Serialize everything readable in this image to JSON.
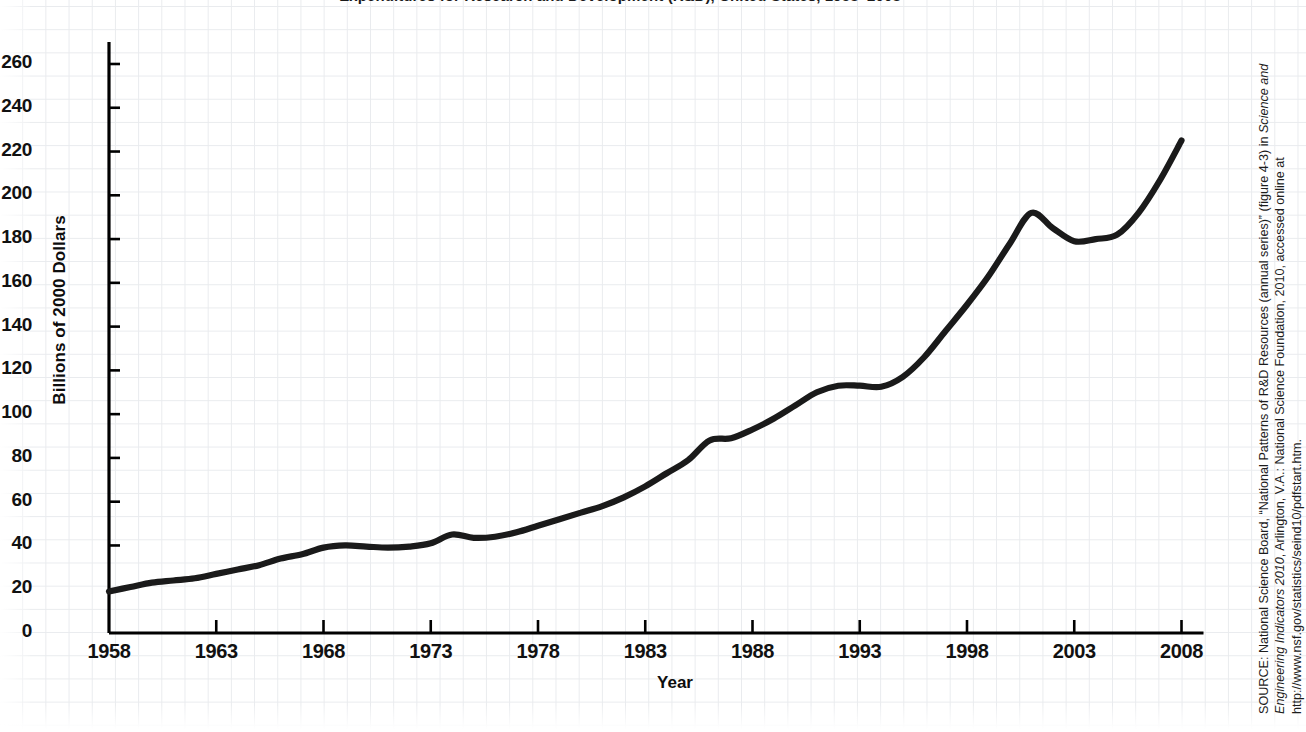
{
  "figure": {
    "title_truncated": "Expenditures for Research and Development (R&D), United States, 1958–2008",
    "ylabel": "Billions of 2000 Dollars",
    "xlabel": "Year",
    "source_prefix": "SOURCE: National Science Board, “National Patterns of R&D Resources (annual series)” (figure 4-3) in ",
    "source_italic": "Science and Engineering Indicators 2010",
    "source_suffix": ", Arlington, V.A.: National Science Foundation, 2010, accessed online at http://www.nsf.gov/statistics/seind10/pdfstart.htm.",
    "line_color": "#1a1a1a",
    "axis_color": "#000000",
    "grid_color": "#e9ebee"
  },
  "chart_data": {
    "type": "line",
    "title": "Expenditures for Research and Development (R&D), United States, 1958–2008",
    "xlabel": "Year",
    "ylabel": "Billions of 2000 Dollars",
    "xlim": [
      1958,
      2008
    ],
    "ylim": [
      0,
      270
    ],
    "grid": true,
    "legend": "none",
    "ytick_labels": [
      "0",
      "20",
      "40",
      "60",
      "80",
      "100",
      "120",
      "140",
      "160",
      "180",
      "200",
      "220",
      "240",
      "260"
    ],
    "ytick_values": [
      0,
      20,
      40,
      60,
      80,
      100,
      120,
      140,
      160,
      180,
      200,
      220,
      240,
      260
    ],
    "xtick_labels": [
      "1958",
      "1963",
      "1968",
      "1973",
      "1978",
      "1983",
      "1988",
      "1993",
      "1998",
      "2003",
      "2008"
    ],
    "xtick_values": [
      1958,
      1963,
      1968,
      1973,
      1978,
      1983,
      1988,
      1993,
      1998,
      2003,
      2008
    ],
    "series": [
      {
        "name": "Total R&D expenditures",
        "x": [
          1958,
          1959,
          1960,
          1961,
          1962,
          1963,
          1964,
          1965,
          1966,
          1967,
          1968,
          1969,
          1970,
          1971,
          1972,
          1973,
          1974,
          1975,
          1976,
          1977,
          1978,
          1979,
          1980,
          1981,
          1982,
          1983,
          1984,
          1985,
          1986,
          1987,
          1988,
          1989,
          1990,
          1991,
          1992,
          1993,
          1994,
          1995,
          1996,
          1997,
          1998,
          1999,
          2000,
          2001,
          2002,
          2003,
          2004,
          2005,
          2006,
          2007,
          2008
        ],
        "values": [
          19,
          21,
          23,
          24,
          25,
          27,
          29,
          31,
          34,
          36,
          39,
          40,
          39.5,
          39,
          39.5,
          41,
          45,
          43.5,
          44,
          46,
          49,
          52,
          55,
          58,
          62,
          67,
          73,
          79,
          88,
          89,
          93,
          98,
          104,
          110,
          113,
          113,
          112.5,
          117,
          126,
          138,
          150,
          163,
          178,
          192,
          185,
          179,
          180,
          182,
          192,
          207,
          225
        ]
      }
    ]
  },
  "axis_geometry": {
    "x0_px": 109,
    "px_per_year": 21.45,
    "y0_px": 633,
    "px_per_unit": 2.1885
  }
}
